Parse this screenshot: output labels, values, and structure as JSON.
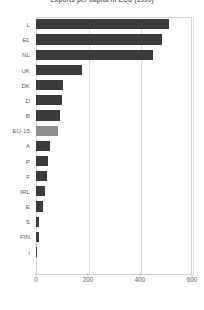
{
  "chart_data": {
    "type": "bar",
    "orientation": "horizontal",
    "title": "Exports per capita in ECU (1999)",
    "xlabel": "",
    "ylabel": "",
    "xlim": [
      0,
      600
    ],
    "xticks": [
      0,
      200,
      400,
      600
    ],
    "grid": true,
    "legend": false,
    "bar_color": "#3b3b3b",
    "highlight_color": "#8d8d8d",
    "highlight_category": "EU-15",
    "categories": [
      "L",
      "EL",
      "NL",
      "UK",
      "DK",
      "D",
      "B",
      "EU-15",
      "A",
      "P",
      "F",
      "IRL",
      "E",
      "S",
      "FIN",
      "I"
    ],
    "values": [
      510,
      485,
      450,
      175,
      105,
      100,
      93,
      85,
      55,
      48,
      42,
      35,
      28,
      12,
      10,
      5
    ],
    "series": [
      {
        "name": "Exports per capita",
        "values": [
          510,
          485,
          450,
          175,
          105,
          100,
          93,
          85,
          55,
          48,
          42,
          35,
          28,
          12,
          10,
          5
        ]
      }
    ]
  }
}
